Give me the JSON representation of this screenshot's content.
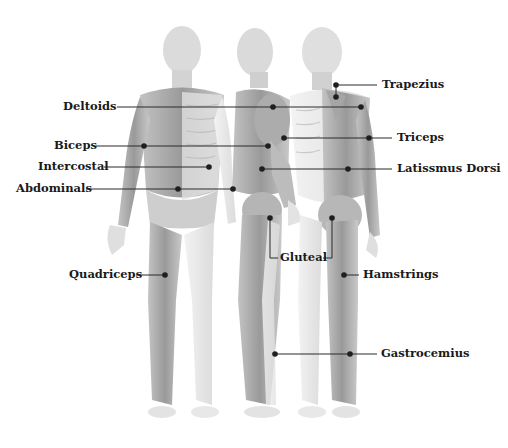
{
  "diagram": {
    "type": "anatomical-muscle-diagram",
    "views": [
      "front",
      "side",
      "back"
    ],
    "colors": {
      "leader_line": "#2a2a2a",
      "muscle": "#9a9a9a",
      "bone": "#e2e2e2",
      "label": "#1a1a1a"
    },
    "labels": [
      {
        "id": "deltoids",
        "text": "Deltoids",
        "x": 63,
        "y": 99
      },
      {
        "id": "biceps",
        "text": "Biceps",
        "x": 54,
        "y": 138
      },
      {
        "id": "intercostal",
        "text": "Intercostal",
        "x": 38,
        "y": 159
      },
      {
        "id": "abdominals",
        "text": "Abdominals",
        "x": 16,
        "y": 182
      },
      {
        "id": "quadriceps",
        "text": "Quadriceps",
        "x": 69,
        "y": 268
      },
      {
        "id": "trapezius",
        "text": "Trapezius",
        "x": 383,
        "y": 79
      },
      {
        "id": "triceps",
        "text": "Triceps",
        "x": 397,
        "y": 133
      },
      {
        "id": "latissimus-dorsi",
        "text": "Latissmus Dorsi",
        "x": 398,
        "y": 163
      },
      {
        "id": "gluteal",
        "text": "Gluteal",
        "x": 281,
        "y": 250
      },
      {
        "id": "hamstrings",
        "text": "Hamstrings",
        "x": 363,
        "y": 268
      },
      {
        "id": "gastrocnemius",
        "text": "Gastrocemius",
        "x": 381,
        "y": 347
      }
    ]
  }
}
